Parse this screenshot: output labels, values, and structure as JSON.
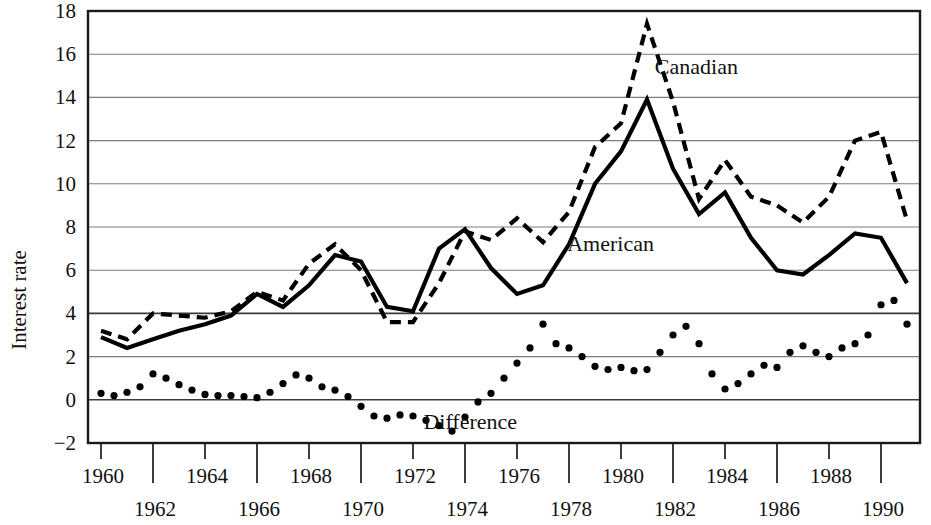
{
  "chart_data": {
    "type": "line",
    "title": "",
    "xlabel": "",
    "ylabel": "Interest rate",
    "xlim": [
      1959.5,
      1991.5
    ],
    "ylim": [
      -2,
      18
    ],
    "ytick_step": 2,
    "xtick_step": 2,
    "grid": true,
    "grid_axis": "y",
    "legend": "inline-annotations",
    "ytick_labels": [
      "-2",
      "0",
      "2",
      "4",
      "6",
      "8",
      "10",
      "12",
      "14",
      "16",
      "18"
    ],
    "ytick_values": [
      -2,
      0,
      2,
      4,
      6,
      8,
      10,
      12,
      14,
      16,
      18
    ],
    "xtick_labels": [
      "1960",
      "1962",
      "1964",
      "1966",
      "1968",
      "1970",
      "1972",
      "1974",
      "1976",
      "1978",
      "1980",
      "1982",
      "1984",
      "1986",
      "1988",
      "1990"
    ],
    "xtick_values": [
      1960,
      1962,
      1964,
      1966,
      1968,
      1970,
      1972,
      1974,
      1976,
      1978,
      1980,
      1982,
      1984,
      1986,
      1988,
      1990
    ],
    "xtick_rows": [
      0,
      1,
      0,
      1,
      0,
      1,
      0,
      1,
      0,
      1,
      0,
      1,
      0,
      1,
      0,
      1
    ],
    "annotations": [
      {
        "text": "Canadian",
        "x": 1982.9,
        "y": 15.1
      },
      {
        "text": "American",
        "x": 1979.6,
        "y": 6.9
      },
      {
        "text": "Difference",
        "x": 1974.2,
        "y": -1.35
      }
    ],
    "series": [
      {
        "name": "Canadian",
        "style": "dashed",
        "x": [
          1960,
          1961,
          1962,
          1963,
          1964,
          1965,
          1966,
          1967,
          1968,
          1969,
          1970,
          1971,
          1972,
          1973,
          1974,
          1975,
          1976,
          1977,
          1978,
          1979,
          1980,
          1981,
          1982,
          1983,
          1984,
          1985,
          1986,
          1987,
          1988,
          1989,
          1990,
          1991
        ],
        "values": [
          3.2,
          2.8,
          4.0,
          3.9,
          3.8,
          4.1,
          5.0,
          4.6,
          6.3,
          7.2,
          6.0,
          3.6,
          3.6,
          5.4,
          7.8,
          7.4,
          8.4,
          7.3,
          8.7,
          11.7,
          12.8,
          17.4,
          13.8,
          9.3,
          11.1,
          9.4,
          9.0,
          8.2,
          9.4,
          12.0,
          12.4,
          8.3
        ]
      },
      {
        "name": "American",
        "style": "solid",
        "x": [
          1960,
          1961,
          1962,
          1963,
          1964,
          1965,
          1966,
          1967,
          1968,
          1969,
          1970,
          1971,
          1972,
          1973,
          1974,
          1975,
          1976,
          1977,
          1978,
          1979,
          1980,
          1981,
          1982,
          1983,
          1984,
          1985,
          1986,
          1987,
          1988,
          1989,
          1990,
          1991
        ],
        "values": [
          2.9,
          2.4,
          2.8,
          3.2,
          3.5,
          3.9,
          4.9,
          4.3,
          5.3,
          6.7,
          6.4,
          4.3,
          4.1,
          7.0,
          7.9,
          6.1,
          4.9,
          5.3,
          7.2,
          10.0,
          11.5,
          13.9,
          10.7,
          8.6,
          9.6,
          7.5,
          6.0,
          5.8,
          6.7,
          7.7,
          7.5,
          5.4
        ]
      },
      {
        "name": "Difference",
        "style": "dotted",
        "x": [
          1960,
          1960.5,
          1961,
          1961.5,
          1962,
          1962.5,
          1963,
          1963.5,
          1964,
          1964.5,
          1965,
          1965.5,
          1966,
          1966.5,
          1967,
          1967.5,
          1968,
          1968.5,
          1969,
          1969.5,
          1970,
          1970.5,
          1971,
          1971.5,
          1972,
          1972.5,
          1973,
          1973.5,
          1974,
          1974.5,
          1975,
          1975.5,
          1976,
          1976.5,
          1977,
          1977.5,
          1978,
          1978.5,
          1979,
          1979.5,
          1980,
          1980.5,
          1981,
          1981.5,
          1982,
          1982.5,
          1983,
          1983.5,
          1984,
          1984.5,
          1985,
          1985.5,
          1986,
          1986.5,
          1987,
          1987.5,
          1988,
          1988.5,
          1989,
          1989.5,
          1990,
          1990.5,
          1991
        ],
        "values": [
          0.3,
          0.2,
          0.35,
          0.6,
          1.2,
          1.0,
          0.7,
          0.45,
          0.25,
          0.2,
          0.2,
          0.15,
          0.1,
          0.35,
          0.75,
          1.15,
          1.0,
          0.6,
          0.45,
          0.15,
          -0.3,
          -0.75,
          -0.85,
          -0.7,
          -0.75,
          -0.95,
          -1.2,
          -1.45,
          -0.8,
          -0.1,
          0.3,
          1.0,
          1.7,
          2.4,
          3.5,
          2.6,
          2.4,
          2.0,
          1.55,
          1.4,
          1.5,
          1.35,
          1.4,
          2.2,
          3.0,
          3.4,
          2.6,
          1.2,
          0.5,
          0.75,
          1.2,
          1.6,
          1.5,
          2.2,
          2.5,
          2.2,
          2.0,
          2.4,
          2.6,
          3.0,
          4.4,
          4.6,
          3.5
        ]
      }
    ]
  },
  "figure": {
    "clipped_top_text": ""
  }
}
